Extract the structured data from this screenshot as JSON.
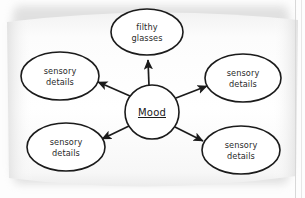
{
  "diagram": {
    "type": "mind-map",
    "center": {
      "label": "Mood",
      "underlined": true,
      "shape": "circle",
      "cx": 152,
      "cy": 112,
      "r": 27
    },
    "nodes": [
      {
        "id": "top",
        "line1": "filthy",
        "line2": "glasses",
        "shape": "ellipse",
        "cx": 147,
        "cy": 32,
        "rx": 36,
        "ry": 23
      },
      {
        "id": "top-left",
        "line1": "sensory",
        "line2": "details",
        "shape": "ellipse",
        "cx": 60,
        "cy": 76,
        "rx": 39,
        "ry": 24
      },
      {
        "id": "top-right",
        "line1": "sensory",
        "line2": "details",
        "shape": "ellipse",
        "cx": 243,
        "cy": 78,
        "rx": 38,
        "ry": 24
      },
      {
        "id": "bottom-left",
        "line1": "sensory",
        "line2": "details",
        "shape": "ellipse",
        "cx": 66,
        "cy": 147,
        "rx": 39,
        "ry": 24
      },
      {
        "id": "bottom-right",
        "line1": "sensory",
        "line2": "details",
        "shape": "ellipse",
        "cx": 241,
        "cy": 150,
        "rx": 39,
        "ry": 24
      }
    ],
    "edges": [
      {
        "from": "center",
        "to": "top",
        "direction": "outward",
        "arrow": true
      },
      {
        "from": "center",
        "to": "top-left",
        "direction": "outward",
        "arrow": true
      },
      {
        "from": "center",
        "to": "top-right",
        "direction": "outward",
        "arrow": true
      },
      {
        "from": "center",
        "to": "bottom-left",
        "direction": "outward",
        "arrow": true
      },
      {
        "from": "center",
        "to": "bottom-right",
        "direction": "outward",
        "arrow": true
      }
    ],
    "colors": {
      "ink": "#1b1b1b",
      "text": "#2a2a2a",
      "paper": "#ffffff",
      "background": "#fdfdfd",
      "shadow": "#c9c9c9"
    }
  }
}
